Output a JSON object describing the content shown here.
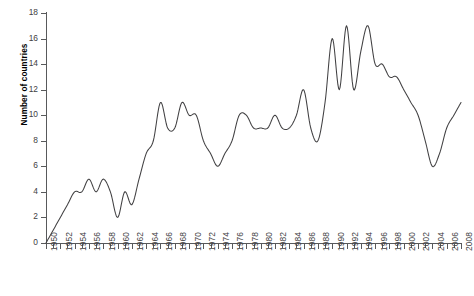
{
  "chart_data": {
    "type": "line",
    "title": "",
    "xlabel": "",
    "ylabel": "Number of countries",
    "xlim": [
      1950,
      2008
    ],
    "ylim": [
      0,
      18
    ],
    "ytick_step": 2,
    "xtick_label_step": 2,
    "grid": false,
    "legend": null,
    "line_color": "#414042",
    "x": [
      1950,
      1951,
      1952,
      1953,
      1954,
      1955,
      1956,
      1957,
      1958,
      1959,
      1960,
      1961,
      1962,
      1963,
      1964,
      1965,
      1966,
      1967,
      1968,
      1969,
      1970,
      1971,
      1972,
      1973,
      1974,
      1975,
      1976,
      1977,
      1978,
      1979,
      1980,
      1981,
      1982,
      1983,
      1984,
      1985,
      1986,
      1987,
      1988,
      1989,
      1990,
      1991,
      1992,
      1993,
      1994,
      1995,
      1996,
      1997,
      1998,
      1999,
      2000,
      2001,
      2002,
      2003,
      2004,
      2005,
      2006,
      2007,
      2008
    ],
    "values": [
      0,
      1,
      2,
      3,
      4,
      4,
      5,
      4,
      5,
      4,
      2,
      4,
      3,
      5,
      7,
      8,
      11,
      9,
      9,
      11,
      10,
      10,
      8,
      7,
      6,
      7,
      8,
      10,
      10,
      9,
      9,
      9,
      10,
      9,
      9,
      10,
      12,
      9,
      8,
      11,
      16,
      12,
      17,
      12,
      15,
      17,
      14,
      14,
      13,
      13,
      12,
      11,
      10,
      8,
      6,
      7,
      9,
      10,
      11
    ],
    "ytick_labels": [
      "0",
      "2",
      "4",
      "6",
      "8",
      "10",
      "12",
      "14",
      "16",
      "18"
    ],
    "xtick_labels": [
      "1950",
      "1952",
      "1954",
      "1956",
      "1958",
      "1960",
      "1962",
      "1964",
      "1966",
      "1968",
      "1970",
      "1972",
      "1974",
      "1976",
      "1978",
      "1980",
      "1982",
      "1984",
      "1986",
      "1988",
      "1990",
      "1992",
      "1994",
      "1996",
      "1998",
      "2000",
      "2002",
      "2004",
      "2006",
      "2008"
    ]
  },
  "axis": {
    "y_title": "Number of countries"
  }
}
